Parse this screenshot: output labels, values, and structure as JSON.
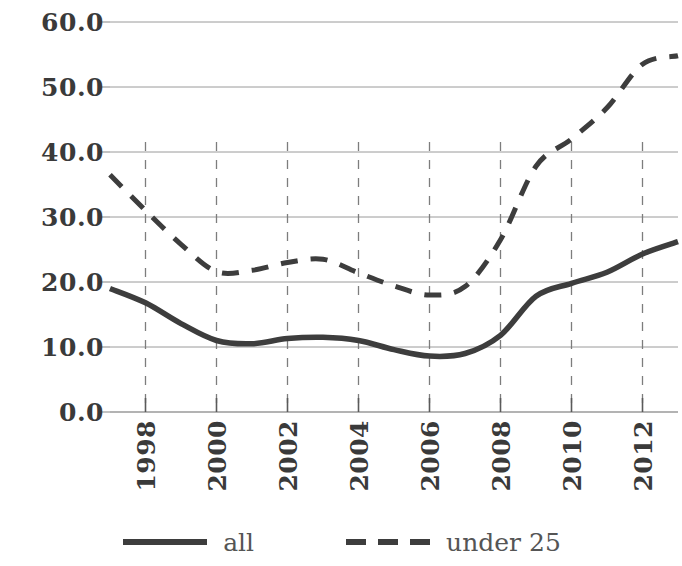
{
  "chart_data": {
    "type": "line",
    "title": "",
    "subtitle": "",
    "xlabel": "",
    "ylabel": "",
    "xlim": [
      1997,
      2013
    ],
    "ylim": [
      0.0,
      60.0
    ],
    "grid": true,
    "y_ticks": [
      "60.0",
      "50.0",
      "40.0",
      "30.0",
      "20.0",
      "10.0",
      "0.0"
    ],
    "y_tick_values": [
      60.0,
      50.0,
      40.0,
      30.0,
      20.0,
      10.0,
      0.0
    ],
    "x_ticks": [
      "1998",
      "2000",
      "2002",
      "2004",
      "2006",
      "2008",
      "2010",
      "2012"
    ],
    "x_tick_values": [
      1998,
      2000,
      2002,
      2004,
      2006,
      2008,
      2010,
      2012
    ],
    "legend_position": "bottom",
    "x": [
      1997,
      1998,
      1999,
      2000,
      2001,
      2002,
      2003,
      2004,
      2005,
      2006,
      2007,
      2008,
      2009,
      2010,
      2011,
      2012,
      2013
    ],
    "series": [
      {
        "name": "all",
        "style": "solid",
        "color": "#3d3d3d",
        "values": [
          19.0,
          16.8,
          13.6,
          11.0,
          10.5,
          11.3,
          11.5,
          11.0,
          9.6,
          8.6,
          9.0,
          11.8,
          17.8,
          19.8,
          21.5,
          24.3,
          26.2
        ]
      },
      {
        "name": "under 25",
        "style": "dashed",
        "color": "#3d3d3d",
        "values": [
          36.5,
          31.0,
          25.8,
          21.6,
          21.8,
          23.0,
          23.5,
          21.4,
          19.4,
          18.0,
          19.3,
          26.5,
          37.8,
          42.0,
          46.8,
          53.5,
          54.8
        ]
      }
    ]
  },
  "legend": {
    "items": [
      {
        "label": "all",
        "style": "solid"
      },
      {
        "label": "under 25",
        "style": "dashed"
      }
    ]
  }
}
